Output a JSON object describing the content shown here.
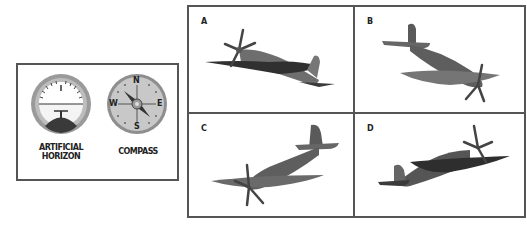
{
  "legend": {
    "instruments": [
      {
        "name": "artificial-horizon",
        "label_line1": "ARTIFICIAL",
        "label_line2": "HORIZON"
      },
      {
        "name": "compass",
        "label": "COMPASS",
        "cardinals": {
          "north": "N",
          "east": "E",
          "south": "S",
          "west": "W"
        }
      }
    ]
  },
  "options": [
    {
      "label": "A",
      "description": "aircraft banked, nose up-left, viewed from below-front"
    },
    {
      "label": "B",
      "description": "aircraft diving toward right, propeller at lower right"
    },
    {
      "label": "C",
      "description": "aircraft climbing toward upper right, propeller at lower left"
    },
    {
      "label": "D",
      "description": "aircraft heading right, banked, propeller at upper right"
    }
  ],
  "colors": {
    "border": "#555555",
    "plane_body": "#6e6e6e",
    "plane_dark": "#3a3a3a",
    "plane_light": "#8a8a8a",
    "dial_bezel": "#9a9a9a",
    "dial_face": "#c8c8c8"
  }
}
